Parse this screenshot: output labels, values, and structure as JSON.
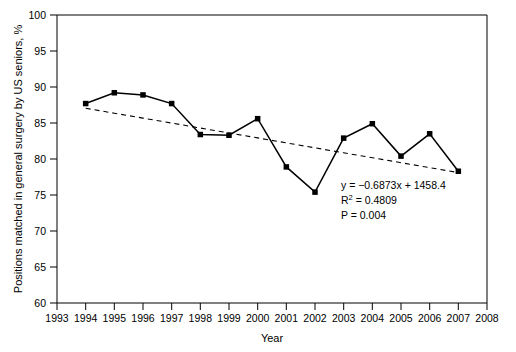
{
  "chart_data": {
    "type": "line",
    "title": "",
    "xlabel": "Year",
    "ylabel": "Positions matched in general surgery by US seniors, %",
    "xlim": [
      1993,
      2008
    ],
    "ylim": [
      60,
      100
    ],
    "xticks": [
      1993,
      1994,
      1995,
      1996,
      1997,
      1998,
      1999,
      2000,
      2001,
      2002,
      2003,
      2004,
      2005,
      2006,
      2007,
      2008
    ],
    "yticks": [
      60,
      65,
      70,
      75,
      80,
      85,
      90,
      95,
      100
    ],
    "grid": false,
    "legend": "none",
    "x": [
      1994,
      1995,
      1996,
      1997,
      1998,
      1999,
      2000,
      2001,
      2002,
      2003,
      2004,
      2005,
      2006,
      2007
    ],
    "series": [
      {
        "name": "Positions matched in general surgery by US seniors",
        "marker": "filled-square",
        "linestyle": "solid",
        "color": "#000000",
        "values": [
          87.7,
          89.2,
          88.9,
          87.7,
          83.4,
          83.3,
          85.6,
          78.9,
          75.4,
          82.9,
          84.9,
          80.4,
          83.5,
          78.3
        ]
      },
      {
        "name": "Linear trendline",
        "marker": "none",
        "linestyle": "dashed",
        "color": "#000000",
        "values": [
          87.05,
          86.36,
          85.68,
          84.99,
          84.3,
          83.61,
          82.93,
          82.24,
          81.55,
          80.86,
          80.18,
          79.49,
          78.8,
          78.11
        ]
      }
    ],
    "annotations": {
      "equation": "y = −0.6873x + 1458.4",
      "r_squared": "R² = 0.4809",
      "p_value": "P = 0.004"
    }
  },
  "axes": {
    "x_title": "Year",
    "y_title": "Positions matched in general surgery by US seniors, %",
    "x_tick_labels": [
      "1993",
      "1994",
      "1995",
      "1996",
      "1997",
      "1998",
      "1999",
      "2000",
      "2001",
      "2002",
      "2003",
      "2004",
      "2005",
      "2006",
      "2007",
      "2008"
    ],
    "y_tick_labels": [
      "100",
      "95",
      "90",
      "85",
      "80",
      "75",
      "70",
      "65",
      "60"
    ]
  },
  "stats": {
    "equation": "y = −0.6873x + 1458.4",
    "r_squared": "R² = 0.4809",
    "p_value": "P = 0.004"
  },
  "colors": {
    "line": "#000000",
    "trend": "#222222",
    "axis": "#000000",
    "background": "#ffffff"
  }
}
